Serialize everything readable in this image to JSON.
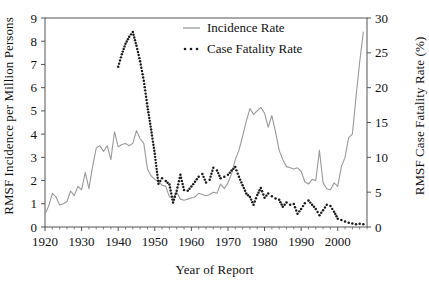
{
  "chart_data": {
    "type": "line",
    "title": "",
    "xlabel": "Year of Report",
    "ylabel": "RMSF Incidence per Million Persons",
    "ylabel_right": "RMSF Case Fatality Rate (%)",
    "xlim": [
      1920,
      2008
    ],
    "ylim": [
      0,
      9
    ],
    "ylim_right": [
      0,
      30
    ],
    "xticks": [
      1920,
      1930,
      1940,
      1950,
      1960,
      1970,
      1980,
      1990,
      2000
    ],
    "xtick_labels": [
      "1920",
      "1930",
      "1940",
      "1950",
      "1960",
      "1970",
      "1980",
      "1990",
      "2000"
    ],
    "yticks": [
      0,
      1,
      2,
      3,
      4,
      5,
      6,
      7,
      8,
      9
    ],
    "ytick_labels": [
      "0",
      "1",
      "2",
      "3",
      "4",
      "5",
      "6",
      "7",
      "8",
      "9"
    ],
    "yticks_right": [
      0,
      5,
      10,
      15,
      20,
      25,
      30
    ],
    "ytick_labels_right": [
      "0",
      "5",
      "10",
      "15",
      "20",
      "25",
      "30"
    ],
    "grid": false,
    "legend_position": "top-center",
    "colors": {
      "incidence": "#9a9a9a",
      "fatality": "#1a1a1a",
      "axis": "#555555",
      "text": "#111111"
    },
    "series": [
      {
        "name": "Incidence Rate",
        "axis": "left",
        "style": "solid",
        "color": "#9a9a9a",
        "x": [
          1920,
          1921,
          1922,
          1923,
          1924,
          1925,
          1926,
          1927,
          1928,
          1929,
          1930,
          1931,
          1932,
          1933,
          1934,
          1935,
          1936,
          1937,
          1938,
          1939,
          1940,
          1941,
          1942,
          1943,
          1944,
          1945,
          1946,
          1947,
          1948,
          1949,
          1950,
          1951,
          1952,
          1953,
          1954,
          1955,
          1956,
          1957,
          1958,
          1959,
          1960,
          1961,
          1962,
          1963,
          1964,
          1965,
          1966,
          1967,
          1968,
          1969,
          1970,
          1971,
          1972,
          1973,
          1974,
          1975,
          1976,
          1977,
          1978,
          1979,
          1980,
          1981,
          1982,
          1983,
          1984,
          1985,
          1986,
          1987,
          1988,
          1989,
          1990,
          1991,
          1992,
          1993,
          1994,
          1995,
          1996,
          1997,
          1998,
          1999,
          2000,
          2001,
          2002,
          2003,
          2004,
          2005,
          2006,
          2007
        ],
        "values": [
          0.55,
          0.9,
          1.45,
          1.3,
          0.95,
          1.0,
          1.1,
          1.55,
          1.35,
          1.75,
          1.6,
          2.35,
          1.65,
          2.6,
          3.4,
          3.5,
          3.25,
          3.5,
          2.9,
          4.1,
          3.45,
          3.55,
          3.6,
          3.5,
          3.6,
          4.15,
          3.8,
          3.6,
          2.5,
          2.2,
          2.05,
          1.95,
          1.8,
          1.75,
          1.3,
          1.25,
          1.5,
          1.2,
          1.15,
          1.2,
          1.25,
          1.3,
          1.45,
          1.4,
          1.35,
          1.4,
          1.5,
          1.45,
          1.85,
          1.65,
          1.9,
          2.3,
          2.9,
          3.3,
          3.9,
          4.55,
          5.1,
          4.85,
          5.0,
          5.15,
          4.9,
          4.3,
          4.8,
          4.1,
          3.3,
          2.9,
          2.6,
          2.55,
          2.5,
          2.55,
          2.4,
          1.95,
          1.85,
          2.05,
          2.0,
          3.3,
          1.9,
          1.65,
          1.6,
          1.9,
          1.75,
          2.6,
          3.0,
          3.85,
          4.0,
          5.6,
          7.1,
          8.4
        ]
      },
      {
        "name": "Case Fatality Rate",
        "axis": "right",
        "style": "dotted",
        "color": "#1a1a1a",
        "x": [
          1940,
          1941,
          1942,
          1943,
          1944,
          1945,
          1946,
          1947,
          1948,
          1949,
          1950,
          1951,
          1952,
          1953,
          1954,
          1955,
          1956,
          1957,
          1958,
          1959,
          1960,
          1961,
          1962,
          1963,
          1964,
          1965,
          1966,
          1967,
          1968,
          1969,
          1970,
          1971,
          1972,
          1973,
          1974,
          1975,
          1976,
          1977,
          1978,
          1979,
          1980,
          1981,
          1982,
          1983,
          1984,
          1985,
          1986,
          1987,
          1988,
          1989,
          1990,
          1991,
          1992,
          1993,
          1994,
          1995,
          1996,
          1997,
          1998,
          1999,
          2000,
          2001,
          2002,
          2003,
          2004,
          2005,
          2006,
          2007
        ],
        "values": [
          23.0,
          24.8,
          26.3,
          27.3,
          28.0,
          26.0,
          23.8,
          21.0,
          17.3,
          14.0,
          10.5,
          6.2,
          7.0,
          6.6,
          6.1,
          3.5,
          5.2,
          7.5,
          5.3,
          5.2,
          5.8,
          6.5,
          7.2,
          7.6,
          6.4,
          6.8,
          8.5,
          8.1,
          7.0,
          7.2,
          7.5,
          8.1,
          8.6,
          7.2,
          6.0,
          4.8,
          4.3,
          3.2,
          4.6,
          5.6,
          4.2,
          4.8,
          4.4,
          4.1,
          3.9,
          2.9,
          3.5,
          3.2,
          3.3,
          1.9,
          2.6,
          3.4,
          3.8,
          3.2,
          2.6,
          1.7,
          2.4,
          3.2,
          3.0,
          2.2,
          1.2,
          1.0,
          0.8,
          0.6,
          0.5,
          0.4,
          0.45,
          0.4
        ]
      }
    ],
    "legend": [
      {
        "label": "Incidence Rate",
        "style": "solid",
        "color": "#9a9a9a"
      },
      {
        "label": "Case Fatality Rate",
        "style": "dotted",
        "color": "#1a1a1a"
      }
    ]
  }
}
